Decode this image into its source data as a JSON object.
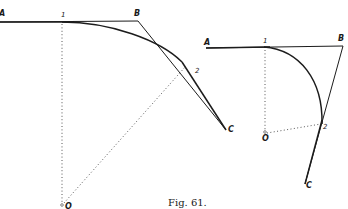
{
  "caption": "Fig. 61.",
  "left_figure": {
    "labels": {
      "A": "A",
      "one": "1",
      "B": "B",
      "two": "2",
      "C": "C",
      "O": "O"
    }
  },
  "right_figure": {
    "labels": {
      "A": "A",
      "one": "1",
      "B": "B",
      "two": "2",
      "C": "C",
      "O": "O"
    }
  },
  "colors": {
    "ink": "#1c1c1c",
    "background": "#ffffff"
  }
}
